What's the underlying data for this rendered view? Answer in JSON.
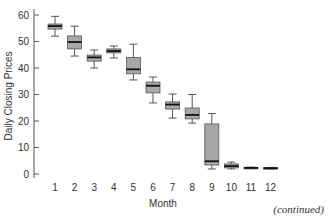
{
  "chart_data": {
    "type": "box",
    "title": "",
    "xlabel": "Month",
    "ylabel": "Daily Closing Prices",
    "categories": [
      "1",
      "2",
      "3",
      "4",
      "5",
      "6",
      "7",
      "8",
      "9",
      "10",
      "11",
      "12"
    ],
    "ylim": [
      0,
      60
    ],
    "yticks": [
      0,
      10,
      20,
      30,
      40,
      50,
      60
    ],
    "grid": false,
    "legend": null,
    "boxes": [
      {
        "month": "1",
        "min": 52.0,
        "q1": 54.7,
        "median": 55.8,
        "q3": 56.6,
        "max": 59.5
      },
      {
        "month": "2",
        "min": 44.5,
        "q1": 47.2,
        "median": 49.8,
        "q3": 52.1,
        "max": 55.8
      },
      {
        "month": "3",
        "min": 40.0,
        "q1": 42.6,
        "median": 44.0,
        "q3": 44.9,
        "max": 46.8
      },
      {
        "month": "4",
        "min": 43.8,
        "q1": 45.7,
        "median": 46.4,
        "q3": 47.2,
        "max": 48.3
      },
      {
        "month": "5",
        "min": 35.5,
        "q1": 37.8,
        "median": 39.5,
        "q3": 44.0,
        "max": 49.0
      },
      {
        "month": "6",
        "min": 26.8,
        "q1": 30.6,
        "median": 33.3,
        "q3": 34.7,
        "max": 36.6
      },
      {
        "month": "7",
        "min": 21.1,
        "q1": 24.5,
        "median": 26.2,
        "q3": 27.2,
        "max": 30.2
      },
      {
        "month": "8",
        "min": 19.2,
        "q1": 20.8,
        "median": 22.3,
        "q3": 24.9,
        "max": 30.0
      },
      {
        "month": "9",
        "min": 1.9,
        "q1": 3.4,
        "median": 4.8,
        "q3": 18.9,
        "max": 22.8
      },
      {
        "month": "10",
        "min": 1.9,
        "q1": 2.3,
        "median": 3.0,
        "q3": 3.8,
        "max": 4.5
      },
      {
        "month": "11",
        "min": 2.0,
        "q1": 2.1,
        "median": 2.3,
        "q3": 2.5,
        "max": 2.6
      },
      {
        "month": "12",
        "min": 1.9,
        "q1": 2.0,
        "median": 2.2,
        "q3": 2.4,
        "max": 2.5
      }
    ],
    "colors": {
      "box_fill": "#a8a8a8",
      "box_stroke": "#555555",
      "median": "#111111",
      "whisker": "#555555",
      "axis": "#555555",
      "text": "#333333"
    }
  },
  "footer": {
    "note": "(continued)"
  }
}
